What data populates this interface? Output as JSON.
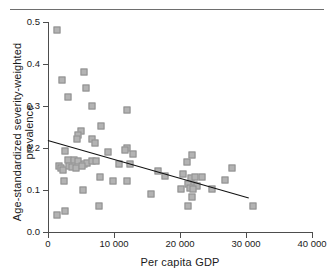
{
  "figure": {
    "cropped_caption_above_rule": "",
    "background_color": "#ffffff",
    "marker_fill": "#b3b3b3",
    "marker_stroke": "#8f8f8f",
    "axis_color": "#4d4d4d",
    "trend_color": "#111111"
  },
  "chart_data": {
    "type": "scatter",
    "title": "",
    "xlabel": "Per capita GDP",
    "ylabel": "Age-standardized severity-weighted prevalence",
    "xlim": [
      0,
      40000
    ],
    "ylim": [
      0.0,
      0.5
    ],
    "grid": false,
    "legend": null,
    "xticks": [
      0,
      10000,
      20000,
      30000,
      40000
    ],
    "xticklabels": [
      "0",
      "10 000",
      "20 000",
      "30 000",
      "40 000"
    ],
    "yticks": [
      0.0,
      0.1,
      0.2,
      0.3,
      0.4,
      0.5
    ],
    "yticklabels": [
      "0.0",
      "0.1",
      "0.2",
      "0.3",
      "0.4",
      "0.5"
    ],
    "points": [
      [
        1300,
        0.482
      ],
      [
        2100,
        0.362
      ],
      [
        3000,
        0.322
      ],
      [
        5400,
        0.382
      ],
      [
        5700,
        0.342
      ],
      [
        6600,
        0.301
      ],
      [
        11900,
        0.291
      ],
      [
        8000,
        0.252
      ],
      [
        5000,
        0.241
      ],
      [
        4500,
        0.231
      ],
      [
        4400,
        0.222
      ],
      [
        6700,
        0.221
      ],
      [
        7100,
        0.212
      ],
      [
        12000,
        0.201
      ],
      [
        11700,
        0.196
      ],
      [
        9100,
        0.191
      ],
      [
        2600,
        0.192
      ],
      [
        12900,
        0.186
      ],
      [
        21800,
        0.183
      ],
      [
        3000,
        0.171
      ],
      [
        4000,
        0.172
      ],
      [
        4500,
        0.168
      ],
      [
        5500,
        0.162
      ],
      [
        5900,
        0.164
      ],
      [
        6600,
        0.168
      ],
      [
        7200,
        0.169
      ],
      [
        12400,
        0.162
      ],
      [
        21100,
        0.166
      ],
      [
        27900,
        0.153
      ],
      [
        1600,
        0.156
      ],
      [
        1900,
        0.152
      ],
      [
        2300,
        0.148
      ],
      [
        3200,
        0.158
      ],
      [
        3600,
        0.154
      ],
      [
        4200,
        0.152
      ],
      [
        5100,
        0.158
      ],
      [
        10800,
        0.161
      ],
      [
        16600,
        0.146
      ],
      [
        17700,
        0.134
      ],
      [
        20500,
        0.137
      ],
      [
        21600,
        0.128
      ],
      [
        22300,
        0.132
      ],
      [
        23300,
        0.131
      ],
      [
        7900,
        0.131
      ],
      [
        2400,
        0.121
      ],
      [
        9900,
        0.121
      ],
      [
        11900,
        0.121
      ],
      [
        26800,
        0.123
      ],
      [
        21200,
        0.114
      ],
      [
        22100,
        0.111
      ],
      [
        22600,
        0.11
      ],
      [
        21500,
        0.105
      ],
      [
        22000,
        0.102
      ],
      [
        20200,
        0.103
      ],
      [
        24800,
        0.102
      ],
      [
        5300,
        0.1
      ],
      [
        15600,
        0.091
      ],
      [
        21800,
        0.084
      ],
      [
        7800,
        0.062
      ],
      [
        21200,
        0.063
      ],
      [
        31100,
        0.063
      ],
      [
        2600,
        0.051
      ],
      [
        1300,
        0.041
      ]
    ],
    "trend_line": {
      "x_start": 0,
      "y_start": 0.218,
      "x_end": 30400,
      "y_end": 0.081,
      "slope_per_10000_gdp": -0.045
    }
  }
}
